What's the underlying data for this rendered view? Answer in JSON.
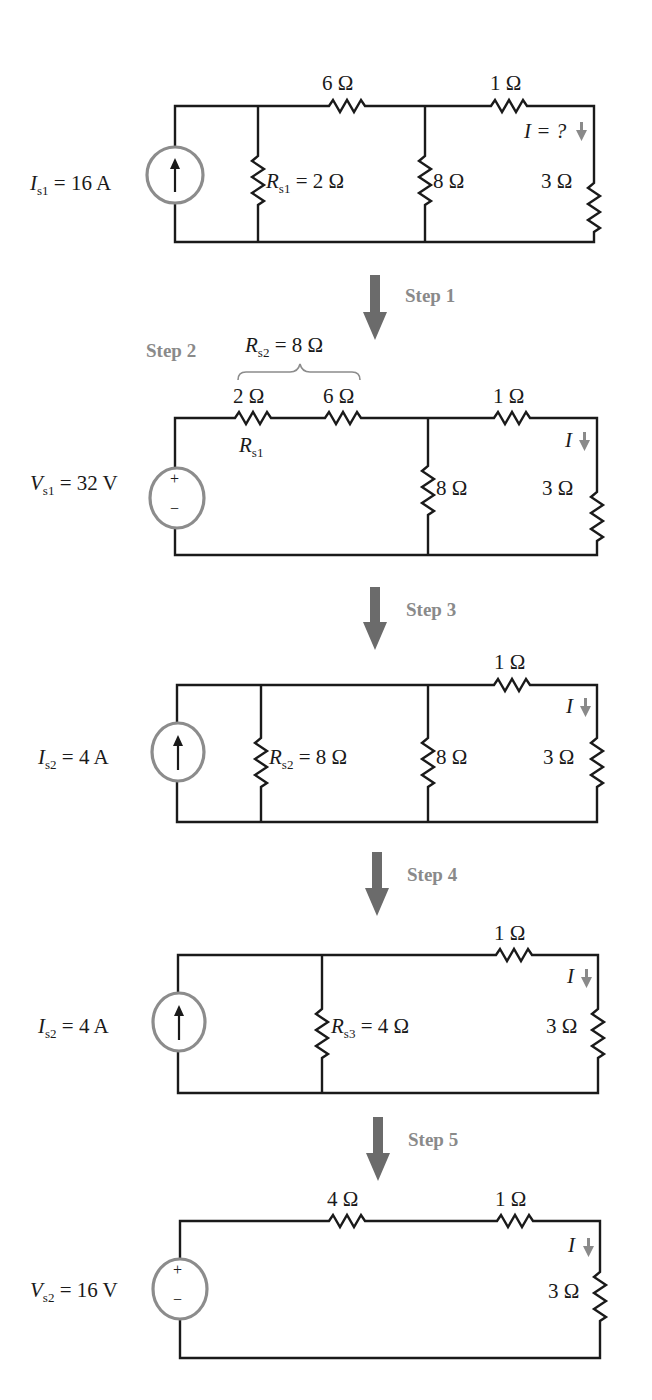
{
  "colors": {
    "wire": "#1a1a1a",
    "source_outline": "#8c8c8c",
    "step_arrow": "#6b6b6b",
    "step_text": "#8a8a8a",
    "current_arrow": "#8a8a8a"
  },
  "circuits": [
    {
      "id": "original",
      "source": {
        "symbol": "I",
        "sub": "s1",
        "rest": " = 16 A",
        "type": "current"
      },
      "labels": {
        "r6": "6 Ω",
        "r1": "1 Ω",
        "rs1_sym": "R",
        "rs1_sub": "s1",
        "rs1_rest": " = 2 Ω",
        "r8": "8 Ω",
        "r3": "3 Ω",
        "current": "I = ?"
      }
    },
    {
      "id": "step2",
      "source": {
        "symbol": "V",
        "sub": "s1",
        "rest": " = 32 V",
        "type": "voltage",
        "plus": "+",
        "minus": "−"
      },
      "labels": {
        "rs2_sym": "R",
        "rs2_sub": "s2",
        "rs2_rest": " = 8 Ω",
        "r2": "2 Ω",
        "r6": "6 Ω",
        "r1": "1 Ω",
        "rs1_sym": "R",
        "rs1_sub": "s1",
        "r8": "8 Ω",
        "r3": "3 Ω",
        "current": "I"
      }
    },
    {
      "id": "step3",
      "source": {
        "symbol": "I",
        "sub": "s2",
        "rest": " = 4 A",
        "type": "current"
      },
      "labels": {
        "r1": "1 Ω",
        "rs2_sym": "R",
        "rs2_sub": "s2",
        "rs2_rest": " = 8 Ω",
        "r8": "8 Ω",
        "r3": "3 Ω",
        "current": "I"
      }
    },
    {
      "id": "step4",
      "source": {
        "symbol": "I",
        "sub": "s2",
        "rest": " = 4 A",
        "type": "current"
      },
      "labels": {
        "r1": "1 Ω",
        "rs3_sym": "R",
        "rs3_sub": "s3",
        "rs3_rest": " = 4 Ω",
        "r3": "3 Ω",
        "current": "I"
      }
    },
    {
      "id": "step5",
      "source": {
        "symbol": "V",
        "sub": "s2",
        "rest": " = 16 V",
        "type": "voltage",
        "plus": "+",
        "minus": "−"
      },
      "labels": {
        "r4": "4 Ω",
        "r1": "1 Ω",
        "r3": "3 Ω",
        "current": "I"
      }
    }
  ],
  "steps": [
    "Step 1",
    "Step 2",
    "Step 3",
    "Step 4",
    "Step 5"
  ]
}
